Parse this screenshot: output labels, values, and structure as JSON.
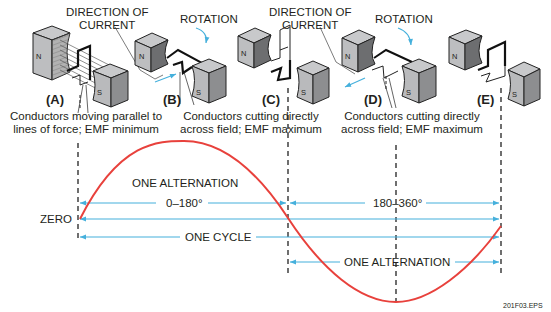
{
  "header": {
    "direction_of_current_1": [
      "DIRECTION OF",
      "CURRENT"
    ],
    "direction_of_current_2": [
      "DIRECTION OF",
      "CURRENT"
    ],
    "rotation_1": "ROTATION",
    "rotation_2": "ROTATION"
  },
  "generators": [
    {
      "label": "(A)",
      "north": "N",
      "south": "S"
    },
    {
      "label": "(B)",
      "north": "N",
      "south": "S"
    },
    {
      "label": "(C)",
      "north": "N",
      "south": "S"
    },
    {
      "label": "(D)",
      "north": "N",
      "south": "S"
    },
    {
      "label": "(E)",
      "north": "N",
      "south": "S"
    }
  ],
  "captions": {
    "a_line1": "Conductors moving parallel to",
    "a_line2": "lines of force; EMF minimum",
    "b_line1": "Conductors cutting directly",
    "b_line2": "across field; EMF maximum",
    "d_line1": "Conductors cutting directly",
    "d_line2": "across field; EMF maximum"
  },
  "waveform": {
    "zero_label": "ZERO",
    "one_alternation_top": "ONE ALTERNATION",
    "range_first": "0–180°",
    "range_second": "180–360°",
    "one_cycle": "ONE CYCLE",
    "one_alternation_bottom": "ONE ALTERNATION",
    "wave_color": "#e8413c",
    "arrow_color": "#45b0dc"
  },
  "figure_id": "201F03.EPS"
}
